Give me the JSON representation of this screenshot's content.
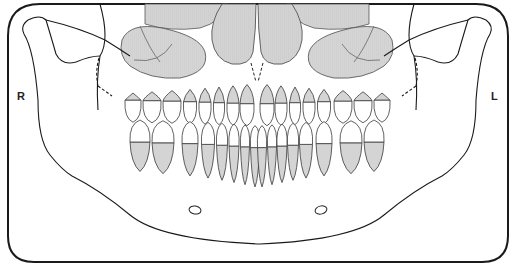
{
  "diagram": {
    "type": "dental panoramic chart",
    "labels": {
      "right": "R",
      "left": "L"
    },
    "colors": {
      "outline": "#1a1a1a",
      "tooth_outline": "#3a3a3a",
      "root_fill": "#d4d4d4",
      "sinus_fill": "#d0d0d0",
      "sinus_stroke": "#555555",
      "background": "#ffffff"
    },
    "structures": [
      "mandible outline",
      "condyles and coronoid processes",
      "maxillary sinuses",
      "nasal cavity",
      "upper dentition (16 teeth)",
      "lower dentition (16 teeth)",
      "mental foramina"
    ],
    "teeth": {
      "upper_count": 16,
      "lower_count": 16
    }
  }
}
